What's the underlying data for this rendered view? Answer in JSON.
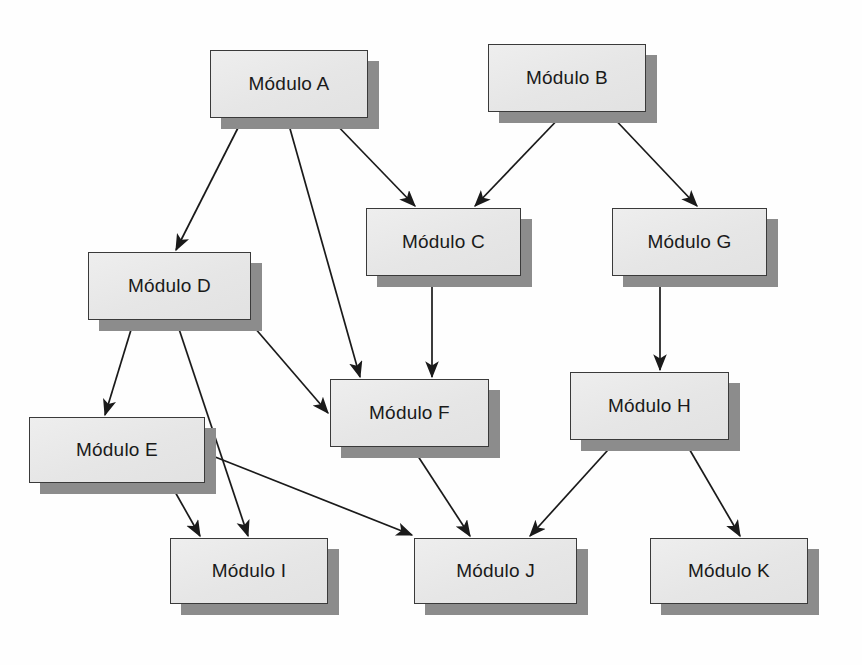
{
  "diagram": {
    "background_color": "#fefefe",
    "node_fill_color": "#e8e8e8",
    "node_border_color": "#3a3a3a",
    "node_shadow_color": "#8c8c8c",
    "edge_color": "#1a1a1a",
    "nodes": [
      {
        "id": "A",
        "label": "Módulo A",
        "x": 210,
        "y": 50,
        "w": 158,
        "h": 68
      },
      {
        "id": "B",
        "label": "Módulo B",
        "x": 488,
        "y": 44,
        "w": 158,
        "h": 68
      },
      {
        "id": "C",
        "label": "Módulo C",
        "x": 366,
        "y": 208,
        "w": 155,
        "h": 68
      },
      {
        "id": "G",
        "label": "Módulo G",
        "x": 612,
        "y": 208,
        "w": 155,
        "h": 68
      },
      {
        "id": "D",
        "label": "Módulo D",
        "x": 88,
        "y": 252,
        "w": 163,
        "h": 68
      },
      {
        "id": "F",
        "label": "Módulo F",
        "x": 330,
        "y": 379,
        "w": 159,
        "h": 68
      },
      {
        "id": "H",
        "label": "Módulo H",
        "x": 570,
        "y": 372,
        "w": 159,
        "h": 68
      },
      {
        "id": "E",
        "label": "Módulo E",
        "x": 29,
        "y": 417,
        "w": 176,
        "h": 66
      },
      {
        "id": "I",
        "label": "Módulo I",
        "x": 170,
        "y": 538,
        "w": 158,
        "h": 66
      },
      {
        "id": "J",
        "label": "Módulo J",
        "x": 414,
        "y": 538,
        "w": 163,
        "h": 66
      },
      {
        "id": "K",
        "label": "Módulo K",
        "x": 650,
        "y": 538,
        "w": 158,
        "h": 66
      }
    ],
    "edges": [
      {
        "id": "A-D",
        "from": "A",
        "to": "D",
        "x1": 243,
        "y1": 118,
        "x2": 176,
        "y2": 250
      },
      {
        "id": "A-F",
        "from": "A",
        "to": "F",
        "x1": 287,
        "y1": 118,
        "x2": 360,
        "y2": 377
      },
      {
        "id": "A-C",
        "from": "A",
        "to": "C",
        "x1": 330,
        "y1": 118,
        "x2": 415,
        "y2": 206
      },
      {
        "id": "B-C",
        "from": "B",
        "to": "C",
        "x1": 565,
        "y1": 112,
        "x2": 475,
        "y2": 206
      },
      {
        "id": "B-G",
        "from": "B",
        "to": "G",
        "x1": 608,
        "y1": 112,
        "x2": 697,
        "y2": 206
      },
      {
        "id": "C-F",
        "from": "C",
        "to": "F",
        "x1": 432,
        "y1": 276,
        "x2": 432,
        "y2": 377
      },
      {
        "id": "G-H",
        "from": "G",
        "to": "H",
        "x1": 660,
        "y1": 276,
        "x2": 660,
        "y2": 370
      },
      {
        "id": "D-E",
        "from": "D",
        "to": "E",
        "x1": 134,
        "y1": 320,
        "x2": 105,
        "y2": 415
      },
      {
        "id": "D-I",
        "from": "D",
        "to": "I",
        "x1": 176,
        "y1": 320,
        "x2": 248,
        "y2": 536
      },
      {
        "id": "D-F",
        "from": "D",
        "to": "F",
        "x1": 248,
        "y1": 320,
        "x2": 328,
        "y2": 413
      },
      {
        "id": "E-I",
        "from": "E",
        "to": "I",
        "x1": 170,
        "y1": 483,
        "x2": 200,
        "y2": 536
      },
      {
        "id": "E-J",
        "from": "E",
        "to": "J",
        "x1": 205,
        "y1": 453,
        "x2": 412,
        "y2": 535
      },
      {
        "id": "F-J",
        "from": "F",
        "to": "J",
        "x1": 412,
        "y1": 447,
        "x2": 470,
        "y2": 536
      },
      {
        "id": "H-J",
        "from": "H",
        "to": "J",
        "x1": 617,
        "y1": 440,
        "x2": 530,
        "y2": 536
      },
      {
        "id": "H-K",
        "from": "H",
        "to": "K",
        "x1": 684,
        "y1": 440,
        "x2": 740,
        "y2": 536
      }
    ]
  }
}
